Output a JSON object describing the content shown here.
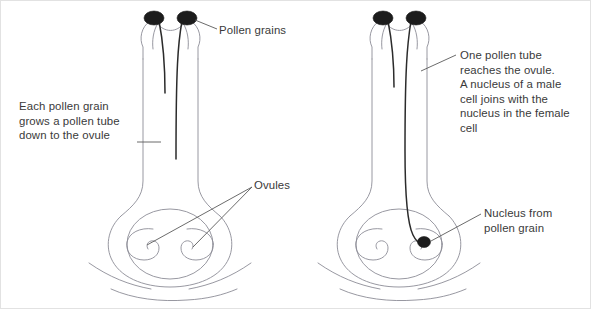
{
  "figure": {
    "kind": "biology-diagram",
    "panels": [
      {
        "id": "left-panel",
        "name": "pollen-tubes-growing",
        "description": "Two pollen grains on the stigma each growing a pollen tube down the style toward the ovules"
      },
      {
        "id": "right-panel",
        "name": "fertilisation",
        "description": "One pollen tube has reached the ovule and its nucleus has joined the female nucleus"
      }
    ]
  },
  "labels": {
    "pollen_grains": "Pollen grains",
    "each_pollen_grain": "Each pollen grain\ngrows a pollen tube\ndown to the ovule",
    "ovules": "Ovules",
    "one_pollen_tube": "One pollen tube\nreaches the ovule.\nA nucleus of a male\ncell joins with the\nnucleus in the female\ncell",
    "nucleus_from_pollen_grain": "Nucleus from\npollen grain"
  },
  "colors": {
    "background": "#ffffff",
    "outline": "#8c8c96",
    "text": "#3a3a3a",
    "leader_line": "#5a5a5a",
    "pollen_grain_fill": "#1c1c1c",
    "pollen_tube": "#2b2b2b",
    "nucleus_fill": "#1c1c1c",
    "border": "#e2e2e2"
  },
  "structures": {
    "left": {
      "stigma": "stigma-left",
      "style": "style-left",
      "ovary": "ovary-left",
      "receptacle": "receptacle-left",
      "ovule_count": 2,
      "pollen_grain_count": 2,
      "pollen_tube_count": 2
    },
    "right": {
      "stigma": "stigma-right",
      "style": "style-right",
      "ovary": "ovary-right",
      "receptacle": "receptacle-right",
      "ovule_count": 2,
      "pollen_grain_count": 2,
      "pollen_tube_count": 2,
      "nucleus_count": 1
    }
  }
}
